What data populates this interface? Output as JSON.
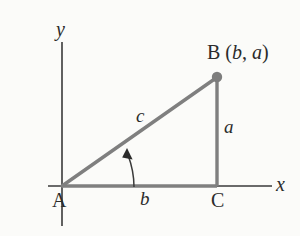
{
  "figure": {
    "kind": "right-triangle-coordinate-diagram",
    "background_color": "#fbfbf9",
    "ink_color": "#2b2b2b",
    "triangle_color": "#808080",
    "axes": {
      "x_label": "x",
      "y_label": "y",
      "x_axis_from": [
        48,
        186
      ],
      "x_axis_to": [
        272,
        186
      ],
      "y_axis_from": [
        62,
        42
      ],
      "y_axis_to": [
        62,
        226
      ]
    },
    "vertices": {
      "a": {
        "label": "A",
        "x": 62,
        "y": 186
      },
      "b": {
        "label": "B",
        "x": 217,
        "y": 77
      },
      "c": {
        "label": "C",
        "x": 217,
        "y": 186
      }
    },
    "point_b": {
      "name": "B",
      "open_paren": "(",
      "coord_x": "b",
      "comma": ", ",
      "coord_y": "a",
      "close_paren": ")",
      "marker": "filled-circle",
      "marker_radius": 5
    },
    "sides": {
      "opposite": {
        "label": "a",
        "note": "vertical leg from C to B"
      },
      "adjacent": {
        "label": "b",
        "note": "horizontal leg from A to C"
      },
      "hypotenuse": {
        "label": "c",
        "note": "from A to B"
      }
    },
    "angle_arc": {
      "at_vertex": "A",
      "marker": "curved-arrow",
      "points_to": "hypotenuse"
    }
  }
}
